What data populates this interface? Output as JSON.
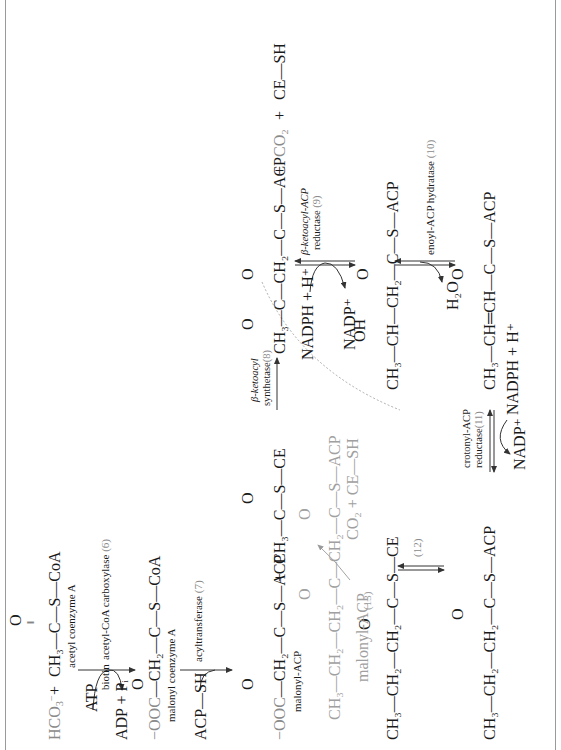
{
  "figure": {
    "orientation": "rotated -90 degrees (reads bottom-to-top)",
    "colors": {
      "ink": "#1a1a1a",
      "highlight_gray": "#8a8a8a",
      "light_gray": "#a0a0a0",
      "border": "#9a9a9a"
    },
    "step1": {
      "reactant_a": "HCO",
      "reactant_a_sub": "3",
      "reactant_a_sup": "−",
      "plus": "+",
      "acetyl_coa_formula": "CH₃—C—S—CoA",
      "acetyl_coa_carbonyl_o": "O",
      "acetyl_coa_name": "acetyl coenzyme A",
      "cofactor_in": "ATP",
      "cofactor_mid": "biotin",
      "cofactor_out": "ADP + Pᵢ",
      "enzyme": "acetyl-CoA carboxylase",
      "enzyme_num": "(6)"
    },
    "step2": {
      "malonyl_coa_prefix": "−OOC",
      "malonyl_coa_formula": "—CH₂—C—S—CoA",
      "malonyl_coa_carbonyl_o": "O",
      "malonyl_coa_name": "malonyl coenzyme A",
      "cofactor_in": "ACP—SH",
      "enzyme": "acyltransferase",
      "enzyme_num": "(7)"
    },
    "step3": {
      "malonyl_acp_prefix": "−OOC",
      "malonyl_acp_formula": "—CH₂—C—S—ACP",
      "malonyl_acp_name": "malonyl-ACP",
      "plus1": "+",
      "acetyl_ce_formula": "CH₃—C—S—CE",
      "enzyme_line1": "β-ketoacyl",
      "enzyme_line2": "synthetase",
      "enzyme_num": "(8)",
      "product_formula": "CH₃—C—CH₂—C—S—ACP",
      "plus2": "+",
      "co2": "CO₂",
      "plus3": "+",
      "ce_sh": "CE—SH",
      "carbonyl_o": "O"
    },
    "step4": {
      "cofactor_in": "NADPH + H⁺",
      "cofactor_out": "NADP⁺",
      "enzyme_line1": "β-ketoacyl-ACP",
      "enzyme_line2": "reductase",
      "enzyme_num": "(9)",
      "product_oh": "OH",
      "product_formula": "CH₃—CH—CH₂—C—S—ACP",
      "carbonyl_o": "O"
    },
    "step5": {
      "byproduct": "H₂O",
      "enzyme": "enoyl-ACP hydratase",
      "enzyme_num": "(10)",
      "product_formula": "CH₃—CH═CH—C—S—ACP",
      "carbonyl_o": "O"
    },
    "step6": {
      "enzyme_line1": "crotonyl-ACP",
      "enzyme_line2": "reductase",
      "enzyme_num": "(11)",
      "cofactor_left": "NADP⁺",
      "cofactor_right": "NADPH + H⁺",
      "substrate_formula": "CH₃—CH₂—CH₂—C—S—ACP",
      "carbonyl_o": "O"
    },
    "step7": {
      "transfer_num": "(12)",
      "butyryl_ce_formula": "CH₃—CH₂—CH₂—C—S—CE",
      "carbonyl_o": "O"
    },
    "cycle": {
      "reactant": "malonyl-ACP",
      "step_num": "(13)",
      "product_formula": "CH₃—CH₂—CH₂—C—CH₂—C—S—ACP",
      "byproducts": "CO₂ + CE—SH",
      "carbonyl_o": "O"
    }
  }
}
